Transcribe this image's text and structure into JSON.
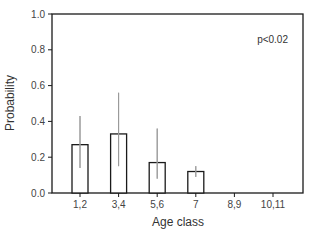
{
  "chart_data": {
    "type": "bar",
    "title": "",
    "xlabel": "Age class",
    "ylabel": "Probability",
    "categories": [
      "1,2",
      "3,4",
      "5,6",
      "7",
      "8,9",
      "10,11"
    ],
    "values": [
      0.27,
      0.33,
      0.17,
      0.12,
      0,
      0
    ],
    "error_bars": {
      "upper": [
        0.43,
        0.56,
        0.36,
        0.15,
        null,
        null
      ],
      "lower": [
        0.14,
        0.15,
        0.08,
        0.09,
        null,
        null
      ]
    },
    "ylim": [
      0,
      1.0
    ],
    "yticks": [
      "0.0",
      "0.2",
      "0.4",
      "0.6",
      "0.8",
      "1.0"
    ],
    "ytick_values": [
      0,
      0.2,
      0.4,
      0.6,
      0.8,
      1.0
    ],
    "grid": false,
    "annotations": [
      {
        "text": "p<0.02",
        "position": "top-right"
      }
    ],
    "legend": null
  },
  "colors": {
    "bar_fill": "#ffffff",
    "bar_stroke": "#1a1a1a",
    "axis": "#1a1a1a",
    "error_bar": "#9a9a9a"
  }
}
